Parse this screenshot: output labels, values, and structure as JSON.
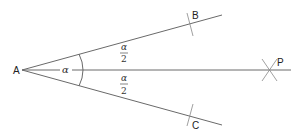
{
  "diagram": {
    "type": "angle-bisector-construction",
    "points": {
      "A": {
        "label": "A"
      },
      "B": {
        "label": "B"
      },
      "C": {
        "label": "C"
      },
      "P": {
        "label": "P"
      }
    },
    "angle_label": "α",
    "half_angle": {
      "numerator": "α",
      "denominator": "2"
    },
    "colors": {
      "line": "#6a6a6a",
      "text": "#222222"
    }
  }
}
